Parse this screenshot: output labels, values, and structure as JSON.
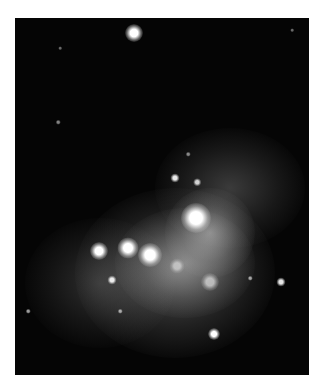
{
  "image": {
    "subject": "nebula-photograph",
    "background": "#050505",
    "frame": {
      "left": 15,
      "top": 18,
      "width": 294,
      "height": 357
    }
  },
  "stars": [
    {
      "x": 119,
      "y": 15,
      "r": 6,
      "brightness": 1.0
    },
    {
      "x": 45,
      "y": 30,
      "r": 1.2,
      "brightness": 0.4
    },
    {
      "x": 277,
      "y": 12,
      "r": 1.2,
      "brightness": 0.4
    },
    {
      "x": 43,
      "y": 104,
      "r": 1.5,
      "brightness": 0.5
    },
    {
      "x": 160,
      "y": 160,
      "r": 3,
      "brightness": 0.9
    },
    {
      "x": 182,
      "y": 164,
      "r": 2.5,
      "brightness": 0.8
    },
    {
      "x": 173,
      "y": 136,
      "r": 1.5,
      "brightness": 0.5
    },
    {
      "x": 84,
      "y": 233,
      "r": 6,
      "brightness": 1.0
    },
    {
      "x": 113,
      "y": 230,
      "r": 7,
      "brightness": 1.0
    },
    {
      "x": 135,
      "y": 237,
      "r": 8,
      "brightness": 1.0
    },
    {
      "x": 181,
      "y": 200,
      "r": 10,
      "brightness": 1.0
    },
    {
      "x": 97,
      "y": 262,
      "r": 3,
      "brightness": 0.9
    },
    {
      "x": 105,
      "y": 293,
      "r": 1.5,
      "brightness": 0.6
    },
    {
      "x": 235,
      "y": 260,
      "r": 1.5,
      "brightness": 0.6
    },
    {
      "x": 266,
      "y": 264,
      "r": 3,
      "brightness": 0.9
    },
    {
      "x": 13,
      "y": 293,
      "r": 1.5,
      "brightness": 0.6
    },
    {
      "x": 199,
      "y": 316,
      "r": 4,
      "brightness": 1.0
    },
    {
      "x": 195,
      "y": 264,
      "r": 6,
      "brightness": 0.6
    },
    {
      "x": 162,
      "y": 248,
      "r": 5,
      "brightness": 0.5
    }
  ],
  "nebula": [
    {
      "x": 60,
      "y": 170,
      "w": 200,
      "h": 170,
      "opacity": 0.35
    },
    {
      "x": 100,
      "y": 190,
      "w": 140,
      "h": 110,
      "opacity": 0.45
    },
    {
      "x": 140,
      "y": 110,
      "w": 150,
      "h": 120,
      "opacity": 0.25
    },
    {
      "x": 150,
      "y": 170,
      "w": 90,
      "h": 90,
      "opacity": 0.5
    },
    {
      "x": 10,
      "y": 200,
      "w": 150,
      "h": 130,
      "opacity": 0.2
    }
  ]
}
